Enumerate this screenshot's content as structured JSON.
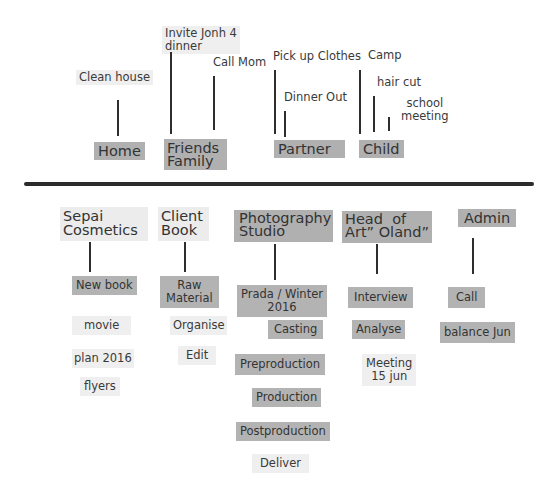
{
  "personal": {
    "categories": [
      {
        "label": "Home"
      },
      {
        "label": "Friends\nFamily"
      },
      {
        "label": "Partner"
      },
      {
        "label": "Child"
      }
    ],
    "tasks": {
      "home": [
        "Clean house"
      ],
      "friends_family": [
        "Invite Jonh 4\ndinner",
        "Call Mom"
      ],
      "partner": [
        "Pick up Clothes",
        "Dinner Out"
      ],
      "child": [
        "Camp",
        "hair cut",
        "school\nmeeting"
      ]
    }
  },
  "work": {
    "categories": [
      {
        "label": "Sepai\nCosmetics"
      },
      {
        "label": "Client\nBook"
      },
      {
        "label": "Photography\nStudio"
      },
      {
        "label": "Head  of\nArt” Oland”"
      },
      {
        "label": "Admin"
      }
    ],
    "tasks": {
      "sepai": [
        "New book",
        "movie",
        "plan 2016",
        "flyers"
      ],
      "client_book": [
        "Raw\nMaterial",
        "Organise",
        "Edit"
      ],
      "photography": [
        "Prada / Winter\n2016",
        "Casting",
        "Preproduction",
        "Production",
        "Postproduction",
        "Deliver"
      ],
      "head_of_art": [
        "Interview",
        "Analyse",
        "Meeting\n15 jun"
      ],
      "admin": [
        "Call",
        "balance  Jun"
      ]
    }
  },
  "colors": {
    "dark_note": "#b3b3b3",
    "light_note": "#efefef",
    "line": "#2e2e2e"
  }
}
